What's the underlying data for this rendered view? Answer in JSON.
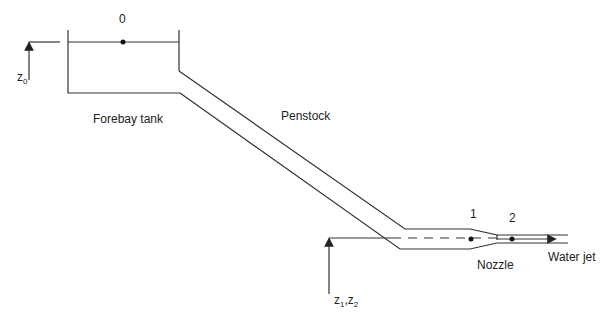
{
  "diagram": {
    "type": "hydraulic-system-schematic",
    "labels": {
      "point0": "0",
      "point1": "1",
      "point2": "2",
      "forebay": "Forebay tank",
      "penstock": "Penstock",
      "nozzle": "Nozzle",
      "water_jet": "Water jet",
      "z0_main": "z",
      "z0_sub": "0",
      "z12_a": "z",
      "z12_a_sub": "1",
      "z12_sep": ",",
      "z12_b": "z",
      "z12_b_sub": "2"
    },
    "colors": {
      "line": "#333333",
      "background": "#ffffff"
    }
  }
}
